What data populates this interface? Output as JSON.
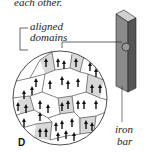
{
  "caption_fragment": "each other.",
  "labels": {
    "aligned": "aligned",
    "domains": "domains",
    "iron": "iron",
    "bar": "bar",
    "panel": "D"
  },
  "colors": {
    "line": "#222222",
    "bar_front": "#8a8a8a",
    "bar_side": "#555555",
    "bar_top": "#cfcfcf",
    "domain_shade": "#d8d8d8"
  }
}
